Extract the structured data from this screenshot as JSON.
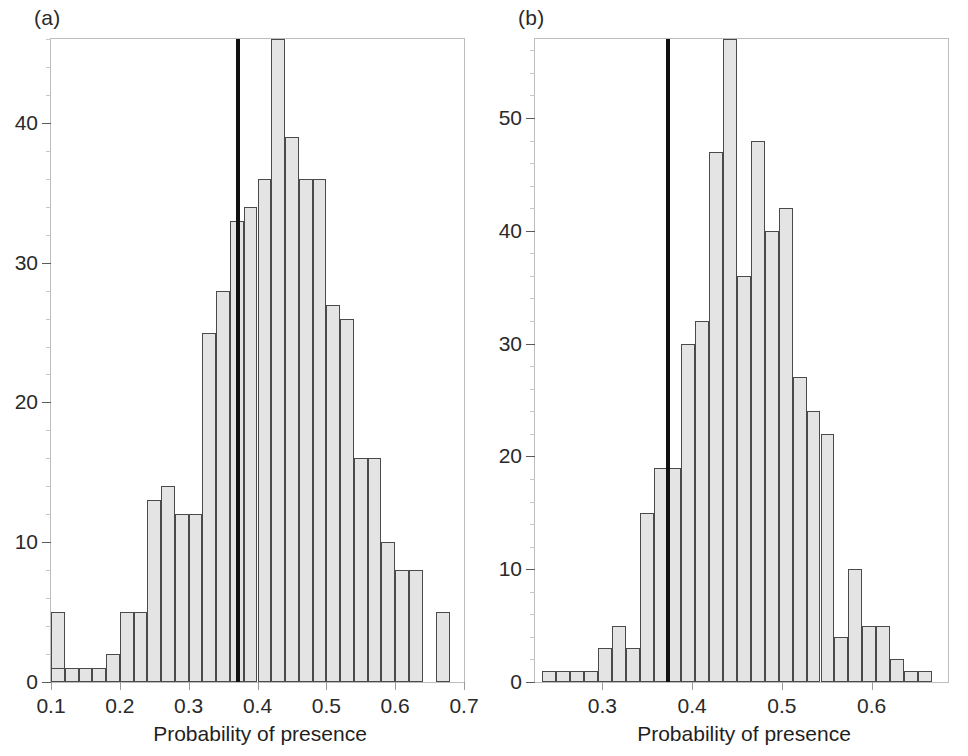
{
  "figure": {
    "background": "#ffffff",
    "bar_fill": "#e4e4e4",
    "bar_stroke": "#4a4a4a",
    "reference_line_color": "#111111",
    "frame_color": "#bdbdbd"
  },
  "panels": [
    {
      "id": "a",
      "label": "(a)",
      "axis_title": "Probability of presence"
    },
    {
      "id": "b",
      "label": "(b)",
      "axis_title": "Probability of presence"
    }
  ],
  "chart_data": [
    {
      "type": "bar",
      "panel": "(a)",
      "title": "",
      "xlabel": "Probability of presence",
      "ylabel": "",
      "xlim": [
        0.1,
        0.7
      ],
      "ylim": [
        0,
        46
      ],
      "xticks": [
        0.1,
        0.2,
        0.3,
        0.4,
        0.5,
        0.6,
        0.7
      ],
      "xtick_labels": [
        "0.1",
        "0.2",
        "0.3",
        "0.4",
        "0.5",
        "0.6",
        "0.7"
      ],
      "yticks": [
        0,
        10,
        20,
        30,
        40
      ],
      "ytick_labels": [
        "0",
        "10",
        "20",
        "30",
        "40"
      ],
      "grid": false,
      "legend": "none",
      "bin_width": 0.02,
      "bin_starts": [
        0.12,
        0.14,
        0.16,
        0.18,
        0.2,
        0.22,
        0.24,
        0.26,
        0.28,
        0.3,
        0.32,
        0.34,
        0.36,
        0.38,
        0.4,
        0.42,
        0.44,
        0.46,
        0.48,
        0.5,
        0.52,
        0.54,
        0.56,
        0.58,
        0.6,
        0.62,
        0.66
      ],
      "values": [
        1,
        1,
        1,
        2,
        5,
        5,
        13,
        14,
        12,
        12,
        25,
        28,
        33,
        34,
        36,
        46,
        39,
        36,
        36,
        27,
        26,
        16,
        16,
        10,
        8,
        8,
        5,
        5,
        1
      ],
      "categories": [
        "0.12",
        "0.14",
        "0.16",
        "0.18",
        "0.20",
        "0.22",
        "0.24",
        "0.26",
        "0.28",
        "0.30",
        "0.32",
        "0.34",
        "0.36",
        "0.38",
        "0.40",
        "0.42",
        "0.44",
        "0.46",
        "0.48",
        "0.50",
        "0.52",
        "0.54",
        "0.56",
        "0.58",
        "0.60",
        "0.62",
        "0.66"
      ],
      "annotations": [
        {
          "type": "vertical-reference-line",
          "x": 0.372,
          "color": "#111111"
        }
      ]
    },
    {
      "type": "bar",
      "panel": "(b)",
      "title": "",
      "xlabel": "Probability of presence",
      "ylabel": "",
      "xlim": [
        0.225,
        0.685
      ],
      "ylim": [
        0,
        57
      ],
      "xticks": [
        0.3,
        0.4,
        0.5,
        0.6
      ],
      "xtick_labels": [
        "0.3",
        "0.4",
        "0.5",
        "0.6"
      ],
      "yticks": [
        0,
        10,
        20,
        30,
        40,
        50
      ],
      "ytick_labels": [
        "0",
        "10",
        "20",
        "30",
        "40",
        "50"
      ],
      "grid": false,
      "legend": "none",
      "bin_width": 0.0155,
      "values": [
        1,
        1,
        1,
        1,
        3,
        5,
        3,
        15,
        19,
        19,
        30,
        32,
        47,
        57,
        36,
        48,
        40,
        42,
        27,
        24,
        22,
        4,
        10,
        5,
        5,
        2,
        1,
        1
      ],
      "categories": [
        "0.233",
        "0.264",
        "0.295",
        "0.311",
        "0.326",
        "0.342",
        "0.357",
        "0.373",
        "0.388",
        "0.404",
        "0.419",
        "0.435",
        "0.450",
        "0.466",
        "0.481",
        "0.497",
        "0.512",
        "0.528",
        "0.543",
        "0.559",
        "0.574",
        "0.590",
        "0.605",
        "0.621",
        "0.636",
        "0.652",
        "0.667",
        "0.683"
      ],
      "annotations": [
        {
          "type": "vertical-reference-line",
          "x": 0.373,
          "color": "#111111"
        }
      ]
    }
  ]
}
